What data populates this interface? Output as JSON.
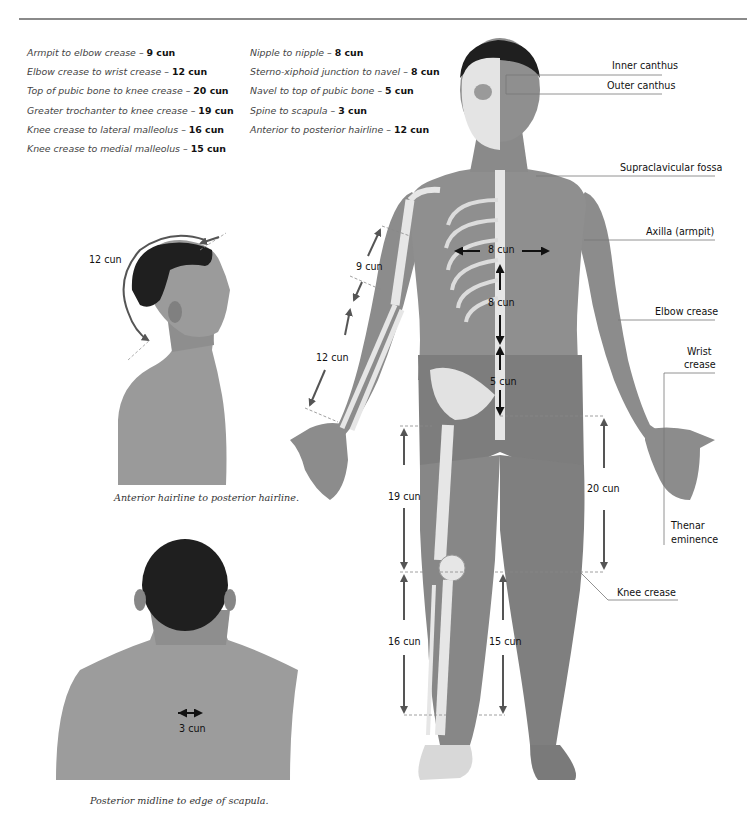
{
  "header": {
    "title_fragment": "g            y"
  },
  "measurements_left": [
    {
      "desc": "Armpit to elbow crease",
      "value": "9 cun"
    },
    {
      "desc": "Elbow crease to wrist crease",
      "value": "12 cun"
    },
    {
      "desc": "Top of pubic bone to knee crease",
      "value": "20 cun"
    },
    {
      "desc": "Greater trochanter to knee crease",
      "value": "19 cun"
    },
    {
      "desc": "Knee crease to lateral malleolus",
      "value": "16 cun"
    },
    {
      "desc": "Knee crease to medial malleolus",
      "value": "15 cun"
    }
  ],
  "measurements_right": [
    {
      "desc": "Nipple to nipple",
      "value": "8 cun"
    },
    {
      "desc": "Sterno-xiphoid junction to navel",
      "value": "8 cun"
    },
    {
      "desc": "Navel to top of pubic bone",
      "value": "5 cun"
    },
    {
      "desc": "Spine to scapula",
      "value": "3 cun"
    },
    {
      "desc": "Anterior to posterior hairline",
      "value": "12 cun"
    }
  ],
  "separator": "–",
  "anatomy_labels": {
    "inner_canthus": "Inner canthus",
    "outer_canthus": "Outer canthus",
    "supraclavicular": "Supraclavicular fossa",
    "axilla": "Axilla  (armpit)",
    "elbow_crease": "Elbow crease",
    "wrist_crease_1": "Wrist",
    "wrist_crease_2": "crease",
    "thenar_1": "Thenar",
    "thenar_2": "eminence",
    "knee_crease": "Knee crease"
  },
  "body_dimensions": {
    "arm_upper": "9 cun",
    "arm_lower": "12 cun",
    "nipples": "8 cun",
    "sternum_navel": "8 cun",
    "navel_pubis": "5 cun",
    "trochanter_knee": "19 cun",
    "pubis_knee": "20 cun",
    "knee_lateral": "16 cun",
    "knee_medial": "15 cun"
  },
  "side_view": {
    "dimension": "12 cun",
    "caption": "Anterior hairline to posterior hairline."
  },
  "back_view": {
    "dimension": "3 cun",
    "caption": "Posterior midline to edge of scapula."
  },
  "colors": {
    "skin": "#8c8c8c",
    "skin_dark": "#6f6f6f",
    "bone": "#e6e6e6",
    "hair": "#1e1e1e",
    "arrow": "#555555",
    "leader": "#777777"
  }
}
